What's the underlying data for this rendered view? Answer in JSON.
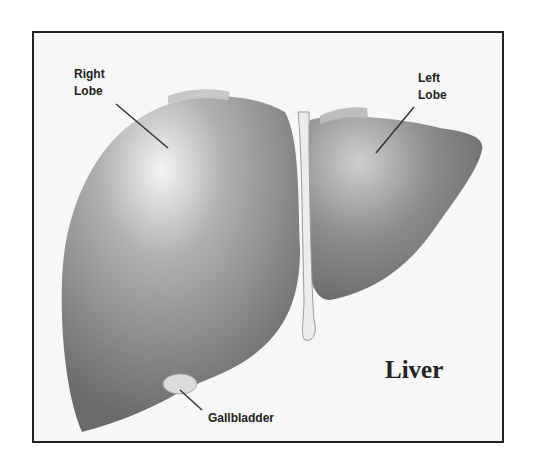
{
  "diagram": {
    "title": "Liver",
    "labels": {
      "right_lobe": [
        "Right",
        "Lobe"
      ],
      "left_lobe": [
        "Left",
        "Lobe"
      ],
      "gallbladder": "Gallbladder"
    },
    "colors": {
      "frame": "#222222",
      "background": "#f7f7f7",
      "organ_dark": "#6a6a6a",
      "organ_light": "#f2f2f2"
    }
  }
}
